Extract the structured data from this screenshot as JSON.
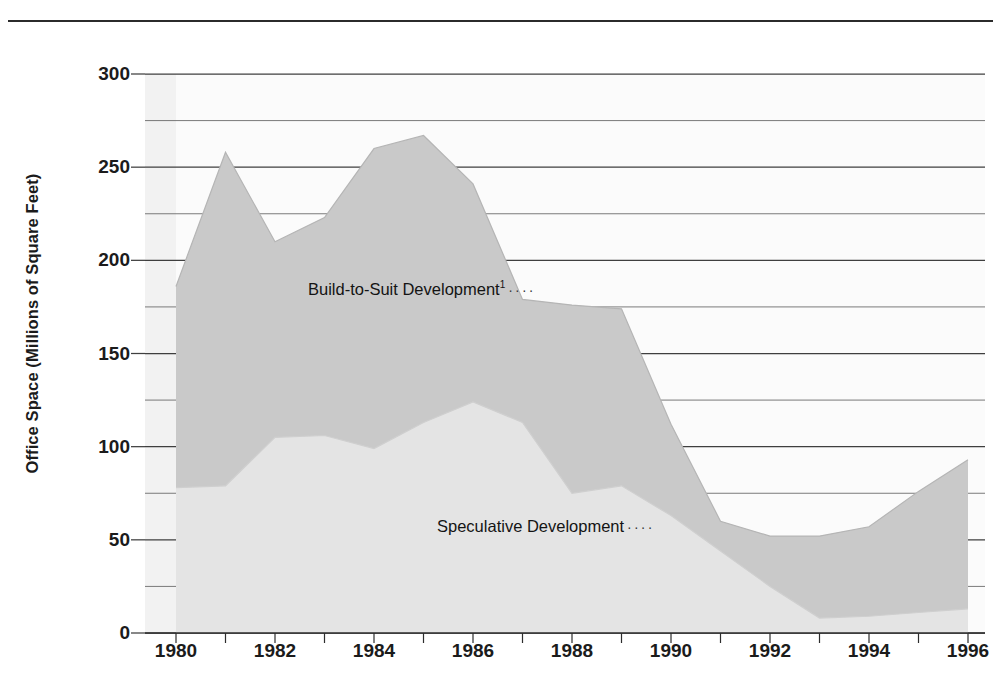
{
  "figure": {
    "y_axis_title": "Office Space (Millions of Square Feet)",
    "series_notes": {
      "build": "Build-to-Suit Development",
      "build_footnote": "1",
      "spec": "Speculative Development",
      "leader": "····"
    }
  },
  "chart_data": {
    "type": "area",
    "stacked": true,
    "title": "",
    "xlabel": "",
    "ylabel": "Office Space (Millions of Square Feet)",
    "xlim": [
      1980,
      1996
    ],
    "ylim": [
      0,
      300
    ],
    "grid": true,
    "grid_interval": 25,
    "legend_position": "in-plot-annotations",
    "x": [
      1980,
      1981,
      1982,
      1983,
      1984,
      1985,
      1986,
      1987,
      1988,
      1989,
      1990,
      1991,
      1992,
      1993,
      1994,
      1995,
      1996
    ],
    "xticks": [
      1980,
      1981,
      1982,
      1983,
      1984,
      1985,
      1986,
      1987,
      1988,
      1989,
      1990,
      1991,
      1992,
      1993,
      1994,
      1995,
      1996
    ],
    "xtick_labels": [
      "1980",
      "",
      "1982",
      "",
      "1984",
      "",
      "1986",
      "",
      "1988",
      "",
      "1990",
      "",
      "1992",
      "",
      "1994",
      "",
      "1996"
    ],
    "yticks": [
      0,
      50,
      100,
      150,
      200,
      250,
      300
    ],
    "ytick_labels": [
      "0",
      "50",
      "100",
      "150",
      "200",
      "250",
      "300"
    ],
    "series": [
      {
        "name": "Speculative Development",
        "color": "#e4e4e4",
        "values": [
          78,
          79,
          105,
          106,
          99,
          113,
          124,
          113,
          75,
          79,
          63,
          44,
          25,
          8,
          9,
          11,
          13
        ]
      },
      {
        "name": "Build-to-Suit Development",
        "color": "#c9c9c9",
        "values": [
          108,
          179,
          105,
          117,
          161,
          154,
          117,
          66,
          101,
          95,
          49,
          16,
          27,
          44,
          48,
          65,
          80
        ]
      }
    ],
    "totals": [
      186,
      258,
      210,
      223,
      260,
      267,
      241,
      179,
      176,
      174,
      112,
      60,
      52,
      52,
      57,
      76,
      93
    ]
  }
}
